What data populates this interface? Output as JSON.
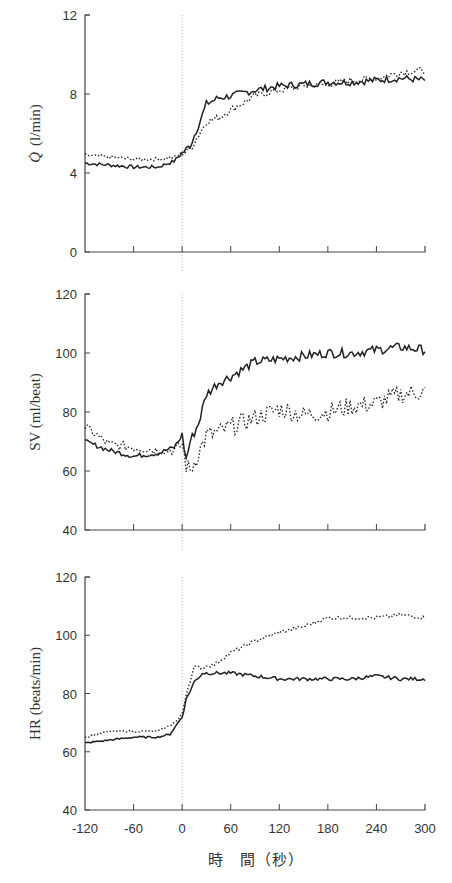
{
  "chart_data": [
    {
      "type": "line",
      "ylabel": "Q̇ (l/min)",
      "ylim": [
        0,
        12
      ],
      "yticks": [
        "0",
        "4",
        "8",
        "12"
      ],
      "xlim": [
        -120,
        300
      ],
      "x": [
        -120,
        -90,
        -60,
        -30,
        -10,
        0,
        10,
        20,
        30,
        45,
        60,
        90,
        120,
        150,
        180,
        210,
        240,
        270,
        300
      ],
      "series": [
        {
          "name": "solid",
          "style": "solid",
          "values": [
            4.5,
            4.4,
            4.3,
            4.3,
            4.6,
            5.0,
            5.4,
            6.4,
            7.5,
            7.8,
            7.9,
            8.2,
            8.4,
            8.5,
            8.6,
            8.6,
            8.7,
            8.8,
            8.7
          ]
        },
        {
          "name": "dotted",
          "style": "dotted",
          "values": [
            4.9,
            4.8,
            4.7,
            4.7,
            4.8,
            5.0,
            5.2,
            5.9,
            6.6,
            6.8,
            7.2,
            7.9,
            8.2,
            8.4,
            8.5,
            8.7,
            8.8,
            9.1,
            9.2
          ]
        }
      ]
    },
    {
      "type": "line",
      "ylabel": "SV (ml/beat)",
      "ylim": [
        40,
        120
      ],
      "yticks": [
        "40",
        "60",
        "80",
        "100",
        "120"
      ],
      "xlim": [
        -120,
        300
      ],
      "x": [
        -120,
        -90,
        -60,
        -30,
        -10,
        0,
        5,
        10,
        20,
        30,
        45,
        60,
        90,
        120,
        150,
        180,
        210,
        240,
        270,
        300
      ],
      "series": [
        {
          "name": "solid",
          "style": "solid",
          "values": [
            70,
            67,
            65,
            66,
            68,
            72,
            64,
            70,
            76,
            86,
            90,
            92,
            97,
            98,
            99,
            100,
            100,
            101,
            102,
            101
          ]
        },
        {
          "name": "dotted",
          "style": "dotted",
          "values": [
            75,
            69,
            68,
            67,
            67,
            69,
            62,
            60,
            66,
            72,
            73,
            75,
            78,
            81,
            79,
            80,
            82,
            83,
            86,
            87
          ]
        }
      ]
    },
    {
      "type": "line",
      "ylabel": "HR (beats/min)",
      "ylim": [
        40,
        120
      ],
      "yticks": [
        "40",
        "60",
        "80",
        "100",
        "120"
      ],
      "xlim": [
        -120,
        300
      ],
      "xticks": [
        "-120",
        "-60",
        "0",
        "60",
        "120",
        "180",
        "240",
        "300"
      ],
      "xlabel": "時 間 (秒)",
      "x": [
        -120,
        -90,
        -60,
        -30,
        -15,
        -5,
        0,
        5,
        15,
        25,
        40,
        60,
        90,
        120,
        150,
        180,
        210,
        240,
        270,
        300
      ],
      "series": [
        {
          "name": "solid",
          "style": "solid",
          "values": [
            63,
            64,
            65,
            65,
            66,
            70,
            72,
            78,
            84,
            87,
            87,
            87,
            86,
            85,
            85,
            85,
            85,
            86,
            85,
            85
          ]
        },
        {
          "name": "dotted",
          "style": "dotted",
          "values": [
            65,
            67,
            67,
            67,
            69,
            71,
            73,
            80,
            89,
            89,
            90,
            94,
            98,
            101,
            103,
            106,
            106,
            106,
            107,
            106
          ]
        }
      ]
    }
  ],
  "labels": {
    "panel1_ylabel_q": "Q",
    "panel1_ylabel_unit": "(l/min)",
    "panel2_ylabel": "SV (ml/beat)",
    "panel3_ylabel": "HR (beats/min)",
    "xlabel": "時　間（秒）"
  }
}
